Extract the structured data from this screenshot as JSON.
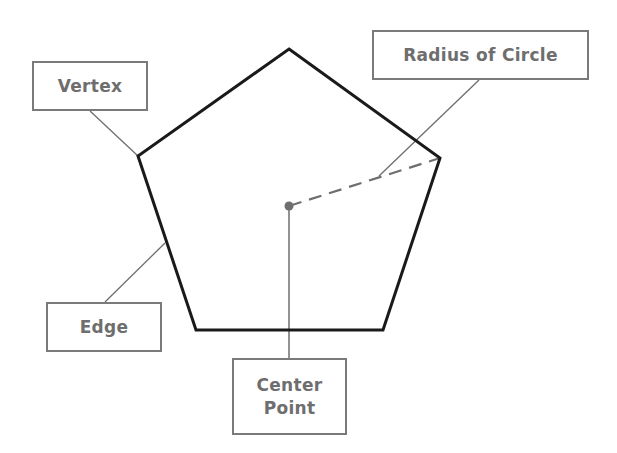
{
  "diagram": {
    "colors": {
      "polygon_stroke": "#1a1a1a",
      "leader_stroke": "#6e6e6e",
      "radius_stroke": "#6e6e6e",
      "center_dot": "#6e6e6e",
      "label_border": "#7a7a7a",
      "label_text": "#6e6e6e",
      "background": "#ffffff"
    },
    "pentagon": {
      "vertices": [
        [
          289,
          49
        ],
        [
          440,
          158
        ],
        [
          383,
          330
        ],
        [
          196,
          330
        ],
        [
          138,
          156
        ]
      ]
    },
    "center_point": [
      289,
      206
    ],
    "radius_line": {
      "from": [
        289,
        206
      ],
      "to": [
        440,
        158
      ],
      "style": "dashed"
    },
    "labels": {
      "vertex": {
        "text": "Vertex",
        "box": [
          32,
          61,
          116,
          50
        ],
        "leader": [
          [
            90,
            111
          ],
          [
            138,
            156
          ]
        ]
      },
      "radius": {
        "text": "Radius of Circle",
        "box": [
          372,
          30,
          217,
          50
        ],
        "leader": [
          [
            479,
            80
          ],
          [
            379,
            176
          ]
        ]
      },
      "edge": {
        "text": "Edge",
        "box": [
          46,
          302,
          116,
          50
        ],
        "leader": [
          [
            105,
            302
          ],
          [
            165,
            243
          ]
        ]
      },
      "center": {
        "line1": "Center",
        "line2": "Point",
        "box": [
          232,
          358,
          115,
          77
        ],
        "leader": [
          [
            289,
            206
          ],
          [
            289,
            358
          ]
        ]
      }
    }
  }
}
